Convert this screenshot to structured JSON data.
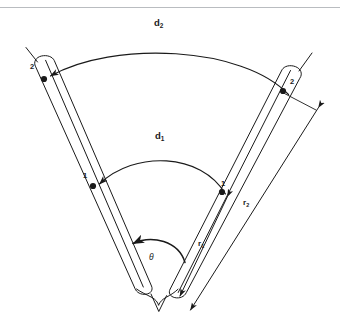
{
  "figure": {
    "background_color": "#ffffff",
    "line_color": "#1a1a1a",
    "rule_color": "#b9bcc0"
  },
  "labels": {
    "arc_outer": "d",
    "arc_outer_sub": "2",
    "arc_inner": "d",
    "arc_inner_sub": "1",
    "radius_outer": "r",
    "radius_outer_sub": "2",
    "radius_inner": "r",
    "radius_inner_sub": "1",
    "angle": "θ",
    "point_left_outer": "2",
    "point_right_outer": "2",
    "point_left_inner": "1",
    "point_right_inner": "1"
  },
  "geometry": {
    "vertex": {
      "x": 160,
      "y": 300
    },
    "angle_degrees": 78,
    "points": [
      {
        "name": "left-outer-contact",
        "label": "2",
        "x": 44,
        "y": 79
      },
      {
        "name": "right-outer-contact",
        "label": "2",
        "x": 283,
        "y": 91
      },
      {
        "name": "left-inner-contact",
        "label": "1",
        "x": 93,
        "y": 186
      },
      {
        "name": "right-inner-contact",
        "label": "1",
        "x": 222,
        "y": 192
      }
    ],
    "arcs": [
      {
        "name": "outer-arc-d2",
        "from": "right-outer-contact",
        "to": "left-outer-contact",
        "arrow_at": "left"
      },
      {
        "name": "inner-arc-d1",
        "from": "right-inner-contact",
        "to": "left-inner-contact",
        "arrow_at": "left"
      },
      {
        "name": "angle-arc-theta",
        "from": "right-probe",
        "to": "left-probe",
        "arrow_at": "left"
      }
    ],
    "dimension_lines": [
      {
        "name": "radius-inner-r1",
        "label": "r1",
        "arrows": "both"
      },
      {
        "name": "radius-outer-r2",
        "label": "r2",
        "arrows": "both"
      }
    ]
  }
}
